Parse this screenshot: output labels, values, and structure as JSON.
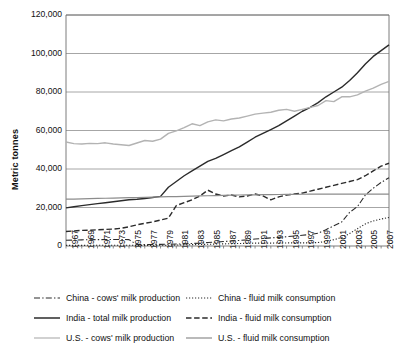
{
  "chart_data": {
    "type": "line",
    "title": "",
    "xlabel": "",
    "ylabel": "Metric tonnes",
    "ylim": [
      0,
      120000
    ],
    "yticks": [
      0,
      20000,
      40000,
      60000,
      80000,
      100000,
      120000
    ],
    "ytick_labels": [
      "0",
      "20,000",
      "40,000",
      "60,000",
      "80,000",
      "100,000",
      "120,000"
    ],
    "grid": true,
    "legend_position": "bottom",
    "x": [
      1967,
      1968,
      1969,
      1970,
      1971,
      1972,
      1973,
      1974,
      1975,
      1976,
      1977,
      1978,
      1979,
      1980,
      1981,
      1982,
      1983,
      1984,
      1985,
      1986,
      1987,
      1988,
      1989,
      1990,
      1991,
      1992,
      1993,
      1994,
      1995,
      1996,
      1997,
      1998,
      1999,
      2000,
      2001,
      2002,
      2003,
      2004,
      2005,
      2006,
      2007,
      2008
    ],
    "xtick_labels": [
      "1967",
      "1969",
      "1971",
      "1973",
      "1975",
      "1977",
      "1979",
      "1981",
      "1983",
      "1985",
      "1987",
      "1989",
      "1991",
      "1993",
      "1995",
      "1997",
      "1999",
      "2001",
      "2003",
      "2005",
      "2007"
    ],
    "series": [
      {
        "name": "China - cows' milk production",
        "style": "dashdot",
        "color": "#2b2b2b",
        "width": 1.1,
        "values": [
          3000,
          3100,
          3200,
          3250,
          3300,
          3350,
          3400,
          3400,
          3300,
          700,
          750,
          800,
          850,
          900,
          1000,
          1100,
          1300,
          1500,
          1800,
          2000,
          2300,
          2600,
          2900,
          3200,
          3600,
          3900,
          4200,
          4500,
          4800,
          5200,
          5600,
          6000,
          6600,
          8500,
          10500,
          12500,
          17500,
          20500,
          26500,
          30000,
          33000,
          35500
        ]
      },
      {
        "name": "China - fluid milk consumption",
        "style": "dotted",
        "color": "#2b2b2b",
        "width": 1.1,
        "values": [
          300,
          320,
          340,
          360,
          380,
          400,
          420,
          430,
          420,
          300,
          320,
          350,
          380,
          420,
          500,
          600,
          700,
          800,
          900,
          1000,
          1100,
          1200,
          1300,
          1400,
          1500,
          1500,
          1500,
          1550,
          1600,
          1600,
          1600,
          1650,
          1800,
          2400,
          3300,
          4400,
          6500,
          9000,
          11500,
          13000,
          14000,
          14800
        ]
      },
      {
        "name": "India - total milk production",
        "style": "solid",
        "color": "#2b2b2b",
        "width": 1.4,
        "values": [
          19800,
          20400,
          21000,
          21500,
          22000,
          22500,
          23000,
          23500,
          24000,
          24300,
          24700,
          25200,
          25800,
          30500,
          33500,
          36500,
          39000,
          41500,
          44000,
          45500,
          47500,
          49500,
          51500,
          54000,
          56500,
          58500,
          60500,
          62500,
          65000,
          67500,
          70000,
          72000,
          74500,
          77500,
          80000,
          82500,
          86000,
          90000,
          94500,
          98500,
          101500,
          104500
        ]
      },
      {
        "name": "India - fluid milk consumption",
        "style": "dashed",
        "color": "#2b2b2b",
        "width": 1.4,
        "values": [
          7500,
          7800,
          8100,
          8200,
          8400,
          8600,
          8800,
          9200,
          10000,
          11000,
          11800,
          12500,
          13500,
          14500,
          21000,
          22500,
          24000,
          26000,
          29000,
          27000,
          26000,
          26500,
          25500,
          26000,
          27000,
          26000,
          24000,
          25500,
          26500,
          27000,
          27500,
          28500,
          29500,
          30500,
          31500,
          32500,
          33500,
          34500,
          36500,
          39000,
          41500,
          43000
        ]
      },
      {
        "name": "U.S. - cows' milk production",
        "style": "solid",
        "color": "#b3b3b3",
        "width": 1.4,
        "values": [
          54000,
          53200,
          53000,
          53300,
          53200,
          53600,
          53000,
          52600,
          52200,
          53500,
          54800,
          54400,
          55500,
          58500,
          59800,
          61500,
          63500,
          62500,
          64500,
          65500,
          65000,
          66000,
          66500,
          67500,
          68500,
          69000,
          69500,
          70500,
          71000,
          70000,
          71000,
          72000,
          73000,
          75500,
          75000,
          77500,
          77500,
          78500,
          80500,
          82000,
          84000,
          85500
        ]
      },
      {
        "name": "U.S. - fluid milk consumption",
        "style": "solid",
        "color": "#8c8c8c",
        "width": 1.2,
        "values": [
          24300,
          24400,
          24500,
          24600,
          24700,
          24800,
          24900,
          25000,
          25100,
          25200,
          25300,
          25400,
          25500,
          25600,
          25700,
          25800,
          25900,
          26000,
          26100,
          26200,
          26300,
          26400,
          26500,
          26550,
          26600,
          26650,
          26700,
          26750,
          26800,
          26850,
          26880,
          26900,
          26920,
          26940,
          26960,
          26980,
          27000,
          27000,
          27000,
          27000,
          27000,
          27000
        ]
      }
    ]
  },
  "axis": {
    "y_title": "Metric tonnes"
  },
  "legend": {
    "rows": [
      {
        "left": {
          "label": "China - cows' milk production",
          "style": "dashdot",
          "color": "#2b2b2b"
        },
        "right": {
          "label": "China - fluid milk consumption",
          "style": "dotted",
          "color": "#2b2b2b"
        }
      },
      {
        "left": {
          "label": "India - total milk production",
          "style": "solid",
          "color": "#2b2b2b"
        },
        "right": {
          "label": "India - fluid milk consumption",
          "style": "dashed",
          "color": "#2b2b2b"
        }
      },
      {
        "left": {
          "label": "U.S. - cows' milk production",
          "style": "solid-light",
          "color": "#b3b3b3"
        },
        "right": {
          "label": "U.S. - fluid milk consumption",
          "style": "solid-gray",
          "color": "#8c8c8c"
        }
      }
    ]
  }
}
